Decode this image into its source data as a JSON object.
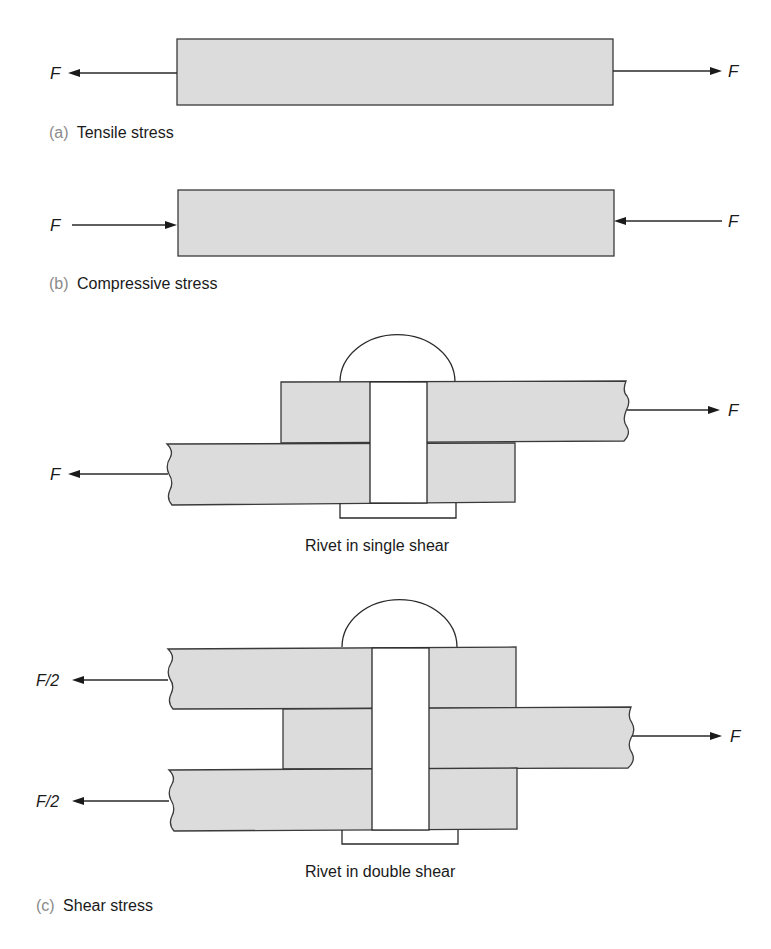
{
  "figure": {
    "tensile": {
      "letter": "(a)",
      "caption": "Tensile stress",
      "left_force": "F",
      "right_force": "F"
    },
    "compressive": {
      "letter": "(b)",
      "caption": "Compressive stress",
      "left_force": "F",
      "right_force": "F"
    },
    "single_shear": {
      "label": "Rivet in single shear",
      "left_force": "F",
      "right_force": "F"
    },
    "double_shear": {
      "label": "Rivet in double shear",
      "left_force_top": "F/2",
      "left_force_bottom": "F/2",
      "right_force": "F"
    },
    "shear": {
      "letter": "(c)",
      "caption": "Shear stress"
    }
  },
  "colors": {
    "plate_fill": "#dcdcdc",
    "outline": "#3a3a3a",
    "caption_letter": "#8a8a8a"
  }
}
